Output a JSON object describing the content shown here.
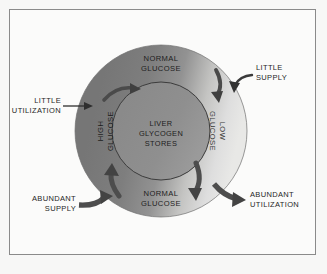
{
  "figure": {
    "border_color": "#8a8a8a",
    "background_color": "#fbfbfa"
  },
  "diagram": {
    "type": "cycle-diagram",
    "center": {
      "line1": "LIVER",
      "line2": "GLYCOGEN",
      "line3": "STORES",
      "fill_color": "#8d8d8d"
    },
    "ring": {
      "gradient_from": "#7b7b7b",
      "gradient_to": "#e2e2e0",
      "labels": [
        {
          "id": "ring-top",
          "line1": "NORMAL",
          "line2": "GLUCOSE",
          "position": "top"
        },
        {
          "id": "ring-left",
          "line1": "HIGH",
          "line2": "GLUCOSE",
          "position": "left"
        },
        {
          "id": "ring-right",
          "line1": "LOW",
          "line2": "GLUCOSE",
          "position": "right"
        },
        {
          "id": "ring-bottom",
          "line1": "NORMAL",
          "line2": "GLUCOSE",
          "position": "bottom"
        }
      ]
    },
    "annotations": [
      {
        "id": "little-utilization",
        "line1": "LITTLE",
        "line2": "UTILIZATION",
        "position": "left-upper",
        "arrow": "thin"
      },
      {
        "id": "little-supply",
        "line1": "LITTLE",
        "line2": "SUPPLY",
        "position": "right-upper",
        "arrow": "thin-curved"
      },
      {
        "id": "abundant-supply",
        "line1": "ABUNDANT",
        "line2": "SUPPLY",
        "position": "left-lower",
        "arrow": "thick-curved"
      },
      {
        "id": "abundant-utilization",
        "line1": "ABUNDANT",
        "line2": "UTILIZATION",
        "position": "right-lower",
        "arrow": "thick-curved"
      }
    ],
    "flow_arrows": [
      {
        "id": "arrow-upper-left",
        "direction": "inward-clockwise",
        "weight": "medium"
      },
      {
        "id": "arrow-upper-right",
        "direction": "inward-clockwise",
        "weight": "medium"
      },
      {
        "id": "arrow-lower-left",
        "direction": "inward-upward",
        "weight": "thick"
      },
      {
        "id": "arrow-lower-right",
        "direction": "outward-downward",
        "weight": "thick"
      }
    ]
  }
}
